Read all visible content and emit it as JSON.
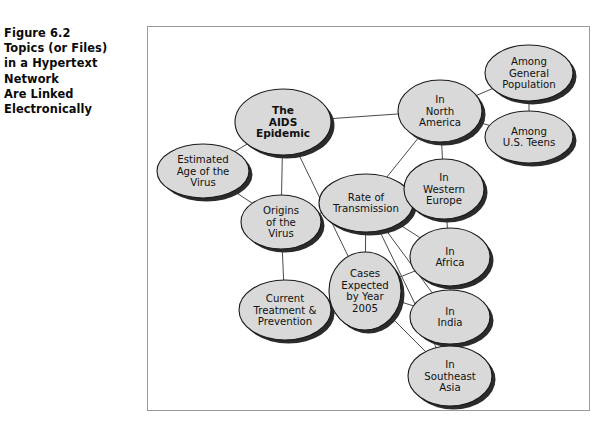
{
  "figure": {
    "caption_lines": [
      "Figure 6.2",
      "Topics (or Files)",
      "in a Hypertext",
      "Network",
      "Are Linked",
      "Electronically"
    ],
    "caption_text": "Figure 6.2 Topics (or Files) in a Hypertext Network Are Linked Electronically"
  },
  "diagram": {
    "type": "node-link-network",
    "frame": {
      "border_color": "#9a9a9a",
      "background": "#ffffff"
    },
    "style": {
      "node_fill": "#d9d9d9",
      "node_stroke": "#1a1a1a",
      "node_shadow": "#2b2b2b",
      "edge_color": "#4a4a4a",
      "label_color": "#111111"
    },
    "nodes": [
      {
        "id": "aids",
        "lines": [
          "The",
          "AIDS",
          "Epidemic"
        ],
        "bold": true,
        "cx": 136,
        "cy": 96,
        "rx": 48,
        "ry": 33
      },
      {
        "id": "estimated_age",
        "lines": [
          "Estimated",
          "Age of the",
          "Virus"
        ],
        "bold": false,
        "cx": 56,
        "cy": 145,
        "rx": 46,
        "ry": 27
      },
      {
        "id": "origins",
        "lines": [
          "Origins",
          "of the",
          "Virus"
        ],
        "bold": false,
        "cx": 134,
        "cy": 196,
        "rx": 40,
        "ry": 27
      },
      {
        "id": "current_treatment",
        "lines": [
          "Current",
          "Treatment &",
          "Prevention"
        ],
        "bold": false,
        "cx": 138,
        "cy": 284,
        "rx": 46,
        "ry": 30
      },
      {
        "id": "rate",
        "lines": [
          "Rate of",
          "Transmission"
        ],
        "bold": false,
        "cx": 219,
        "cy": 177,
        "rx": 47,
        "ry": 29
      },
      {
        "id": "cases",
        "lines": [
          "Cases",
          "Expected",
          "by Year",
          "2005"
        ],
        "bold": false,
        "cx": 218,
        "cy": 265,
        "rx": 36,
        "ry": 39
      },
      {
        "id": "north_america",
        "lines": [
          "In",
          "North",
          "America"
        ],
        "bold": false,
        "cx": 293,
        "cy": 85,
        "rx": 42,
        "ry": 31
      },
      {
        "id": "general_pop",
        "lines": [
          "Among",
          "General",
          "Population"
        ],
        "bold": false,
        "cx": 382,
        "cy": 47,
        "rx": 44,
        "ry": 28
      },
      {
        "id": "us_teens",
        "lines": [
          "Among",
          "U.S. Teens"
        ],
        "bold": false,
        "cx": 382,
        "cy": 111,
        "rx": 44,
        "ry": 26
      },
      {
        "id": "western_europe",
        "lines": [
          "In",
          "Western",
          "Europe"
        ],
        "bold": false,
        "cx": 297,
        "cy": 163,
        "rx": 40,
        "ry": 30
      },
      {
        "id": "africa",
        "lines": [
          "In",
          "Africa"
        ],
        "bold": false,
        "cx": 303,
        "cy": 231,
        "rx": 40,
        "ry": 29
      },
      {
        "id": "india",
        "lines": [
          "In",
          "India"
        ],
        "bold": false,
        "cx": 303,
        "cy": 291,
        "rx": 40,
        "ry": 27
      },
      {
        "id": "southeast_asia",
        "lines": [
          "In",
          "Southeast",
          "Asia"
        ],
        "bold": false,
        "cx": 303,
        "cy": 350,
        "rx": 42,
        "ry": 30
      }
    ],
    "edges": [
      {
        "from": "aids",
        "to": "estimated_age"
      },
      {
        "from": "aids",
        "to": "origins"
      },
      {
        "from": "aids",
        "to": "north_america"
      },
      {
        "from": "aids",
        "to": "cases"
      },
      {
        "from": "estimated_age",
        "to": "origins"
      },
      {
        "from": "origins",
        "to": "current_treatment"
      },
      {
        "from": "origins",
        "to": "rate"
      },
      {
        "from": "north_america",
        "to": "general_pop"
      },
      {
        "from": "north_america",
        "to": "us_teens"
      },
      {
        "from": "north_america",
        "to": "western_europe"
      },
      {
        "from": "north_america",
        "to": "rate"
      },
      {
        "from": "general_pop",
        "to": "us_teens"
      },
      {
        "from": "western_europe",
        "to": "africa"
      },
      {
        "from": "africa",
        "to": "india"
      },
      {
        "from": "india",
        "to": "southeast_asia"
      },
      {
        "from": "rate",
        "to": "cases"
      },
      {
        "from": "rate",
        "to": "africa"
      },
      {
        "from": "rate",
        "to": "india"
      },
      {
        "from": "rate",
        "to": "southeast_asia"
      },
      {
        "from": "cases",
        "to": "africa"
      },
      {
        "from": "cases",
        "to": "india"
      },
      {
        "from": "cases",
        "to": "southeast_asia"
      }
    ]
  }
}
